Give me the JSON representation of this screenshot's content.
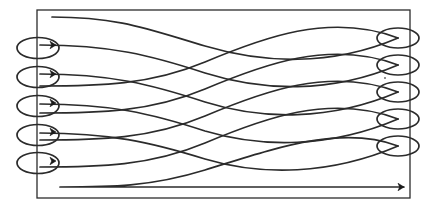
{
  "diagram": {
    "type": "boustrophedon-path-diagram",
    "caption": "",
    "colors": {
      "background": "#ffffff",
      "stroke": "#2b2b2b",
      "arrow_fill": "#1a1a1a",
      "boundary": "#2b2b2b"
    },
    "canvas": {
      "width": 443,
      "height": 211
    },
    "boundary": {
      "label": "survey-area-boundary",
      "x": 37,
      "y": 10,
      "width": 373,
      "height": 188,
      "stroke_width": 1.3
    },
    "path": {
      "label": "serpentine-sweep-path",
      "stroke_width": 1.7,
      "pass_count": 10,
      "start_point": {
        "x": 52,
        "y": 17
      },
      "end_point": {
        "x": 404,
        "y": 187
      },
      "description": "Continuous back-and-forth sweep with looping turns at each end",
      "segments": [
        {
          "id": "p1",
          "direction": "left-to-right",
          "d": "M 52 17 C 120 17 150 30 205 46 C 262 63 330 67 398 38"
        },
        {
          "id": "p2",
          "direction": "right-to-left",
          "d": "M 398 38 C 330 12 262 38 205 62 C 150 85 100 86 40 86"
        },
        {
          "id": "p3",
          "direction": "left-to-right",
          "d": "M 40 45 C 110 45 150 55 205 73 C 262 91 330 94 398 65"
        },
        {
          "id": "p4",
          "direction": "right-to-left",
          "d": "M 398 65 C 330 39 262 65 205 89 C 150 112 100 113 40 113"
        },
        {
          "id": "p5",
          "direction": "left-to-right",
          "d": "M 40 74 C 110 74 150 84 205 102 C 262 120 330 121 398 92"
        },
        {
          "id": "p6",
          "direction": "right-to-left",
          "d": "M 398 92 C 330 66 262 92 205 116 C 150 139 100 140 40 140"
        },
        {
          "id": "p7",
          "direction": "left-to-right",
          "d": "M 40 104 C 110 104 150 113 205 131 C 262 148 330 148 398 119"
        },
        {
          "id": "p8",
          "direction": "right-to-left",
          "d": "M 398 119 C 330 93 262 119 205 143 C 150 166 100 167 40 167"
        },
        {
          "id": "p9",
          "direction": "left-to-right",
          "d": "M 40 133 C 110 133 150 142 205 159 C 262 176 330 175 398 146"
        },
        {
          "id": "p10",
          "direction": "right-to-left-then-out",
          "d": "M 398 146 C 340 124 270 150 205 170 C 150 187 110 187 60 187 L 404 187"
        }
      ]
    },
    "left_turns": {
      "label": "left-turnaround-loops",
      "count": 5,
      "loops": [
        {
          "id": "L1",
          "cx": 38,
          "cy": 48,
          "rx": 21,
          "ry": 10.5
        },
        {
          "id": "L2",
          "cx": 38,
          "cy": 77,
          "rx": 21,
          "ry": 10.5
        },
        {
          "id": "L3",
          "cx": 38,
          "cy": 106,
          "rx": 21,
          "ry": 10.5
        },
        {
          "id": "L4",
          "cx": 38,
          "cy": 135,
          "rx": 21,
          "ry": 10.5
        },
        {
          "id": "L5",
          "cx": 38,
          "cy": 163,
          "rx": 21,
          "ry": 10.5
        }
      ]
    },
    "right_turns": {
      "label": "right-turnaround-loops",
      "count": 5,
      "loops": [
        {
          "id": "R1",
          "cx": 398,
          "cy": 38,
          "rx": 21,
          "ry": 10
        },
        {
          "id": "R2",
          "cx": 398,
          "cy": 65,
          "rx": 21,
          "ry": 10
        },
        {
          "id": "R3",
          "cx": 398,
          "cy": 92,
          "rx": 21,
          "ry": 10
        },
        {
          "id": "R4",
          "cx": 398,
          "cy": 119,
          "rx": 21,
          "ry": 10
        },
        {
          "id": "R5",
          "cx": 398,
          "cy": 146,
          "rx": 21,
          "ry": 10
        }
      ]
    },
    "arrows": {
      "label": "direction-arrowheads",
      "count": 6,
      "markers": [
        {
          "id": "A1",
          "x": 56,
          "y": 45,
          "angle": 0,
          "size": 6,
          "at": "left-loop-1-exit"
        },
        {
          "id": "A2",
          "x": 56,
          "y": 74,
          "angle": 0,
          "size": 6,
          "at": "left-loop-2-exit"
        },
        {
          "id": "A3",
          "x": 56,
          "y": 103,
          "angle": 0,
          "size": 6,
          "at": "left-loop-3-exit"
        },
        {
          "id": "A4",
          "x": 56,
          "y": 132,
          "angle": 0,
          "size": 6,
          "at": "left-loop-4-exit"
        },
        {
          "id": "A5",
          "x": 56,
          "y": 161,
          "angle": 0,
          "size": 6,
          "at": "left-loop-5-exit"
        },
        {
          "id": "A6",
          "x": 404,
          "y": 187,
          "angle": 0,
          "size": 6,
          "at": "path-terminus"
        }
      ]
    },
    "specks": [
      {
        "id": "S1",
        "x": 385,
        "y": 78,
        "r": 1.0
      }
    ]
  }
}
